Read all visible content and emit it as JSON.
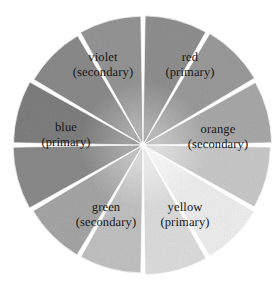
{
  "figure": {
    "type": "color-wheel-diagram",
    "background_color": "#ffffff",
    "label_color": "#141414",
    "separator_color": "#ffffff",
    "center": {
      "x": 143,
      "y": 145
    },
    "radius": 130,
    "segment_count": 12,
    "segment_angle_degrees": 30
  },
  "chart_data": {
    "type": "pie",
    "xlabel": "",
    "ylabel": "",
    "categories": [
      "red",
      "red-orange",
      "orange",
      "yellow-orange",
      "yellow",
      "yellow-green",
      "green",
      "blue-green",
      "blue",
      "blue-violet",
      "violet",
      "red-violet"
    ],
    "values": [
      30,
      30,
      30,
      30,
      30,
      30,
      30,
      30,
      30,
      30,
      30,
      30
    ],
    "slice_tones": [
      "#8f8f8f",
      "#9a9a9a",
      "#a8a8a8",
      "#c8c8c8",
      "#ededed",
      "#dcdcdc",
      "#c0c0c0",
      "#a5a5a5",
      "#8a8a8a",
      "#7e7e7e",
      "#8a8a8a",
      "#949494"
    ],
    "legend_position": "on-slices",
    "grid": false
  },
  "segments": [
    {
      "id": "red",
      "name": "red",
      "role": "(primary)",
      "start_angle": 0,
      "end_angle": 30,
      "tone": "#8f8f8f",
      "tone_inner": "#b4b4b4",
      "labeled": true
    },
    {
      "id": "red-orange",
      "name": "red-orange",
      "role": "",
      "start_angle": 30,
      "end_angle": 60,
      "tone": "#9a9a9a",
      "tone_inner": "#bdbdbd",
      "labeled": false
    },
    {
      "id": "orange",
      "name": "orange",
      "role": "(secondary)",
      "start_angle": 60,
      "end_angle": 90,
      "tone": "#a8a8a8",
      "tone_inner": "#c9c9c9",
      "labeled": true
    },
    {
      "id": "yellow-orange",
      "name": "yellow-orange",
      "role": "",
      "start_angle": 90,
      "end_angle": 120,
      "tone": "#c8c8c8",
      "tone_inner": "#e2e2e2",
      "labeled": false
    },
    {
      "id": "yellow",
      "name": "yellow",
      "role": "(primary)",
      "start_angle": 120,
      "end_angle": 150,
      "tone": "#ededed",
      "tone_inner": "#fafafa",
      "labeled": true
    },
    {
      "id": "yellow-green",
      "name": "yellow-green",
      "role": "",
      "start_angle": 150,
      "end_angle": 180,
      "tone": "#dcdcdc",
      "tone_inner": "#f0f0f0",
      "labeled": false
    },
    {
      "id": "green",
      "name": "green",
      "role": "(secondary)",
      "start_angle": 180,
      "end_angle": 210,
      "tone": "#c0c0c0",
      "tone_inner": "#dedede",
      "labeled": true
    },
    {
      "id": "blue-green",
      "name": "blue-green",
      "role": "",
      "start_angle": 210,
      "end_angle": 240,
      "tone": "#a5a5a5",
      "tone_inner": "#c6c6c6",
      "labeled": false
    },
    {
      "id": "blue",
      "name": "blue",
      "role": "(primary)",
      "start_angle": 240,
      "end_angle": 270,
      "tone": "#8a8a8a",
      "tone_inner": "#adadad",
      "labeled": true
    },
    {
      "id": "blue-violet",
      "name": "blue-violet",
      "role": "",
      "start_angle": 270,
      "end_angle": 300,
      "tone": "#7e7e7e",
      "tone_inner": "#a4a4a4",
      "labeled": false
    },
    {
      "id": "violet",
      "name": "violet",
      "role": "(secondary)",
      "start_angle": 300,
      "end_angle": 330,
      "tone": "#8a8a8a",
      "tone_inner": "#b0b0b0",
      "labeled": true
    },
    {
      "id": "red-violet",
      "name": "red-violet",
      "role": "",
      "start_angle": 330,
      "end_angle": 360,
      "tone": "#949494",
      "tone_inner": "#b8b8b8",
      "labeled": false
    }
  ],
  "labels": {
    "violet": {
      "name": "violet",
      "role": "(secondary)"
    },
    "red": {
      "name": "red",
      "role": "(primary)"
    },
    "blue": {
      "name": "blue",
      "role": "(primary)"
    },
    "orange": {
      "name": "orange",
      "role": "(secondary)"
    },
    "green": {
      "name": "green",
      "role": "(secondary)"
    },
    "yellow": {
      "name": "yellow",
      "role": "(primary)"
    }
  }
}
